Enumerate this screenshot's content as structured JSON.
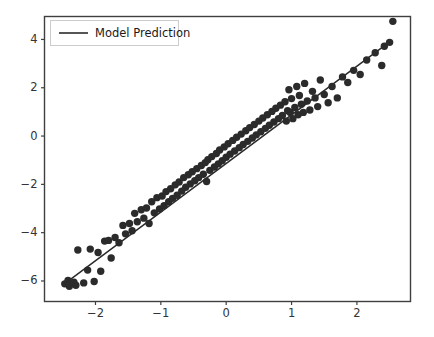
{
  "chart_data": {
    "type": "scatter",
    "title": "",
    "xlabel": "",
    "ylabel": "",
    "xlim": [
      -2.78,
      2.82
    ],
    "ylim": [
      -6.85,
      4.95
    ],
    "grid": false,
    "legend_position": "upper left",
    "xticks": [
      -2,
      -1,
      0,
      1,
      2
    ],
    "xtick_labels": [
      "−2",
      "−1",
      "0",
      "1",
      "2"
    ],
    "yticks": [
      4,
      2,
      0,
      -2,
      -4,
      -6
    ],
    "ytick_labels": [
      "4",
      "2",
      "0",
      "−2",
      "−4",
      "−6"
    ],
    "marker_color": "#2b2b2b",
    "line_color": "#2b2b2b",
    "marker_size": 7.4,
    "series": [
      {
        "name": "Observations",
        "type": "scatter",
        "points": [
          [
            -2.47,
            -6.12
          ],
          [
            -2.42,
            -5.98
          ],
          [
            -2.4,
            -6.22
          ],
          [
            -2.33,
            -6.05
          ],
          [
            -2.3,
            -6.18
          ],
          [
            -2.27,
            -4.72
          ],
          [
            -2.18,
            -6.08
          ],
          [
            -2.12,
            -5.55
          ],
          [
            -2.08,
            -4.68
          ],
          [
            -2.02,
            -6.02
          ],
          [
            -1.96,
            -4.82
          ],
          [
            -1.92,
            -5.6
          ],
          [
            -1.86,
            -4.35
          ],
          [
            -1.8,
            -4.32
          ],
          [
            -1.76,
            -5.05
          ],
          [
            -1.7,
            -4.2
          ],
          [
            -1.64,
            -4.42
          ],
          [
            -1.58,
            -3.7
          ],
          [
            -1.54,
            -4.05
          ],
          [
            -1.48,
            -3.62
          ],
          [
            -1.44,
            -3.92
          ],
          [
            -1.4,
            -3.2
          ],
          [
            -1.36,
            -3.55
          ],
          [
            -1.3,
            -3.05
          ],
          [
            -1.26,
            -3.4
          ],
          [
            -1.22,
            -2.98
          ],
          [
            -1.18,
            -3.62
          ],
          [
            -1.14,
            -2.72
          ],
          [
            -1.1,
            -3.18
          ],
          [
            -1.06,
            -2.55
          ],
          [
            -1.02,
            -3.02
          ],
          [
            -0.98,
            -2.48
          ],
          [
            -0.95,
            -2.88
          ],
          [
            -0.92,
            -2.3
          ],
          [
            -0.88,
            -2.72
          ],
          [
            -0.85,
            -2.18
          ],
          [
            -0.82,
            -2.58
          ],
          [
            -0.78,
            -2.02
          ],
          [
            -0.75,
            -2.45
          ],
          [
            -0.72,
            -1.9
          ],
          [
            -0.68,
            -2.28
          ],
          [
            -0.65,
            -1.72
          ],
          [
            -0.62,
            -2.12
          ],
          [
            -0.58,
            -1.6
          ],
          [
            -0.55,
            -1.98
          ],
          [
            -0.52,
            -1.48
          ],
          [
            -0.48,
            -1.85
          ],
          [
            -0.45,
            -1.35
          ],
          [
            -0.42,
            -1.72
          ],
          [
            -0.38,
            -1.22
          ],
          [
            -0.35,
            -1.58
          ],
          [
            -0.32,
            -1.1
          ],
          [
            -0.3,
            -1.88
          ],
          [
            -0.28,
            -0.98
          ],
          [
            -0.25,
            -1.42
          ],
          [
            -0.22,
            -0.85
          ],
          [
            -0.18,
            -1.28
          ],
          [
            -0.15,
            -0.72
          ],
          [
            -0.12,
            -1.15
          ],
          [
            -0.1,
            -0.58
          ],
          [
            -0.06,
            -1.02
          ],
          [
            -0.03,
            -0.45
          ],
          [
            0.0,
            -0.88
          ],
          [
            0.03,
            -0.32
          ],
          [
            0.06,
            -0.75
          ],
          [
            0.1,
            -0.18
          ],
          [
            0.13,
            -0.62
          ],
          [
            0.16,
            -0.05
          ],
          [
            0.2,
            -0.48
          ],
          [
            0.23,
            0.08
          ],
          [
            0.26,
            -0.35
          ],
          [
            0.3,
            0.22
          ],
          [
            0.33,
            -0.22
          ],
          [
            0.36,
            0.35
          ],
          [
            0.4,
            -0.08
          ],
          [
            0.43,
            0.48
          ],
          [
            0.46,
            0.05
          ],
          [
            0.5,
            0.62
          ],
          [
            0.53,
            0.18
          ],
          [
            0.56,
            0.75
          ],
          [
            0.6,
            0.32
          ],
          [
            0.63,
            0.88
          ],
          [
            0.66,
            0.45
          ],
          [
            0.7,
            1.02
          ],
          [
            0.73,
            0.58
          ],
          [
            0.76,
            1.15
          ],
          [
            0.8,
            0.72
          ],
          [
            0.83,
            1.28
          ],
          [
            0.86,
            0.85
          ],
          [
            0.9,
            1.42
          ],
          [
            0.92,
            0.62
          ],
          [
            0.94,
            1.05
          ],
          [
            0.96,
            1.92
          ],
          [
            0.98,
            0.98
          ],
          [
            1.0,
            1.55
          ],
          [
            1.02,
            0.72
          ],
          [
            1.05,
            1.18
          ],
          [
            1.08,
            2.05
          ],
          [
            1.1,
            0.88
          ],
          [
            1.12,
            1.68
          ],
          [
            1.15,
            1.32
          ],
          [
            1.18,
            0.98
          ],
          [
            1.2,
            2.18
          ],
          [
            1.24,
            1.45
          ],
          [
            1.28,
            1.08
          ],
          [
            1.32,
            1.85
          ],
          [
            1.36,
            1.58
          ],
          [
            1.4,
            1.22
          ],
          [
            1.44,
            2.32
          ],
          [
            1.5,
            1.72
          ],
          [
            1.56,
            1.38
          ],
          [
            1.62,
            2.05
          ],
          [
            1.7,
            1.58
          ],
          [
            1.78,
            2.45
          ],
          [
            1.86,
            2.22
          ],
          [
            1.95,
            2.72
          ],
          [
            2.05,
            2.55
          ],
          [
            2.15,
            3.15
          ],
          [
            2.28,
            3.45
          ],
          [
            2.38,
            2.92
          ],
          [
            2.42,
            3.72
          ],
          [
            2.5,
            3.88
          ],
          [
            2.55,
            4.75
          ]
        ]
      },
      {
        "name": "Model Prediction",
        "type": "line",
        "x_endpoints": [
          -2.44,
          2.5
        ],
        "y_endpoints": [
          -6.05,
          3.9
        ],
        "slope": 2.01,
        "intercept": -1.15
      }
    ],
    "legend_entries": [
      {
        "label": "Model Prediction",
        "marker": "line",
        "color": "#2b2b2b"
      }
    ]
  },
  "figure": {
    "legend_label": "Model Prediction"
  }
}
